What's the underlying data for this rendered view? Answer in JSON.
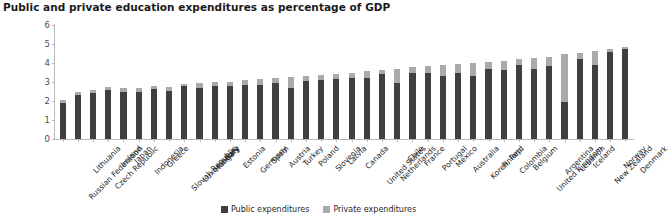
{
  "chart_data": {
    "type": "bar",
    "title": "Public and private education expenditures as percentage of GDP",
    "xlabel": "",
    "ylabel": "Percent of GDP",
    "ylim": [
      0,
      6
    ],
    "yticks": [
      0,
      1,
      2,
      3,
      4,
      5,
      6
    ],
    "grid": false,
    "stacked": true,
    "legend_position": "bottom-center",
    "colors": {
      "public": "#3f3f3f",
      "private": "#aaaaaa",
      "axis": "#b9b9b9",
      "text": "#1f1f1f",
      "background": "#ffffff"
    },
    "categories": [
      "Russian Federation",
      "Lithuania",
      "Czech Republic",
      "Ireland",
      "Japan",
      "Indonesia",
      "Greece",
      "Slovak Republic",
      "Luxembourg",
      "Hungary",
      "Italy",
      "Estonia",
      "Germany",
      "Spain",
      "Austria",
      "Turkey",
      "Poland",
      "Slovenia",
      "Latvia",
      "Canada",
      "United States",
      "Netherlands",
      "Chile",
      "France",
      "Portugal",
      "Mexico",
      "Australia",
      "Korea, Rep.",
      "Finland",
      "Colombia",
      "Belgium",
      "United Kingdom",
      "Argentina",
      "Lebanon",
      "Iceland",
      "New Zealand",
      "Norway",
      "Denmark"
    ],
    "series": [
      {
        "name": "Public expenditures",
        "color": "#3f3f3f",
        "values": [
          1.9,
          2.3,
          2.4,
          2.6,
          2.45,
          2.5,
          2.65,
          2.55,
          2.8,
          2.7,
          2.8,
          2.8,
          2.85,
          2.85,
          2.95,
          2.7,
          3.05,
          3.1,
          3.15,
          3.2,
          3.2,
          3.4,
          2.95,
          3.5,
          3.5,
          3.3,
          3.45,
          3.3,
          3.7,
          3.65,
          3.9,
          3.7,
          3.85,
          1.95,
          4.2,
          3.9,
          4.6,
          4.75
        ]
      },
      {
        "name": "Private expenditures",
        "color": "#aaaaaa",
        "values": [
          0.15,
          0.15,
          0.2,
          0.15,
          0.25,
          0.2,
          0.15,
          0.2,
          0.1,
          0.25,
          0.2,
          0.2,
          0.25,
          0.3,
          0.25,
          0.55,
          0.25,
          0.25,
          0.25,
          0.3,
          0.4,
          0.25,
          0.75,
          0.3,
          0.35,
          0.6,
          0.5,
          0.7,
          0.35,
          0.45,
          0.3,
          0.55,
          0.45,
          2.55,
          0.35,
          0.75,
          0.15,
          0.1
        ]
      }
    ]
  },
  "legend": {
    "items": [
      {
        "label": "Public expenditures",
        "color": "#3f3f3f"
      },
      {
        "label": "Private expenditures",
        "color": "#aaaaaa"
      }
    ]
  }
}
